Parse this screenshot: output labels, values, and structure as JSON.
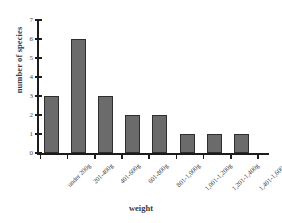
{
  "chart_data": {
    "type": "bar",
    "title": "",
    "xlabel": "weight",
    "ylabel": "number of species",
    "categories": [
      "under 200g",
      "201-400g",
      "401-600g",
      "601-800g",
      "801-1,000g",
      "1,001-1,200g",
      "1,201-1,400g",
      "1,401-1,600g"
    ],
    "values": [
      3,
      6,
      3,
      2,
      2,
      1,
      1,
      1
    ],
    "ylim": [
      0,
      7
    ],
    "yticks": [
      "0",
      "1",
      "2",
      "3",
      "4",
      "5",
      "6",
      "7"
    ],
    "grid": false,
    "legend": false,
    "bar_color": "#6b6b6b",
    "bar_edge_color": "#2e2e2e",
    "axis_color": "#1c1c1c",
    "background_color": "#ffffff"
  }
}
